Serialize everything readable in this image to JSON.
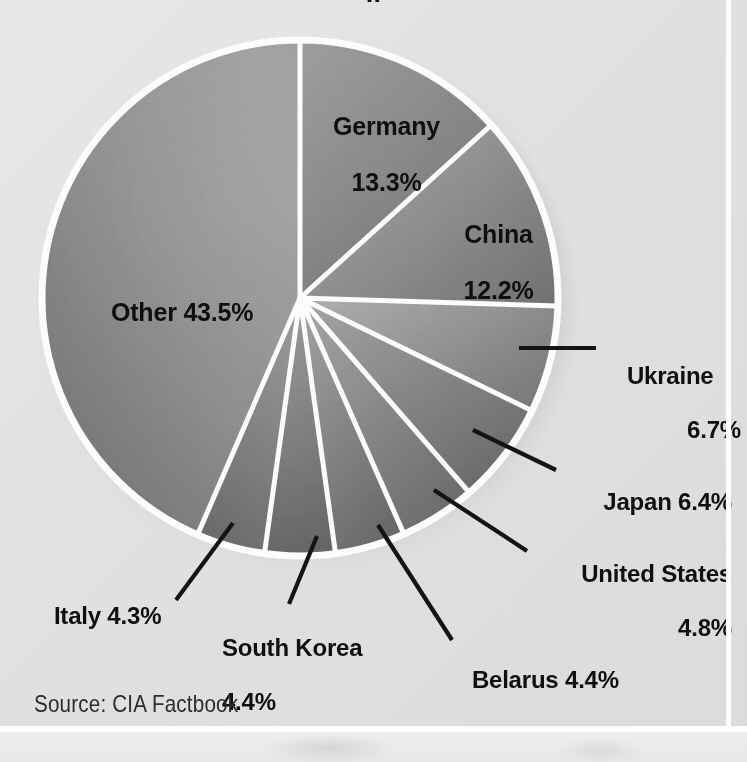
{
  "page": {
    "title_fragment": "..",
    "background_color": "#e8e8e8",
    "source_note": "Source: CIA Factbook"
  },
  "chart_data": {
    "type": "pie",
    "title": "",
    "xlabel": "",
    "ylabel": "",
    "legend_position": "none",
    "grid": false,
    "unit": "%",
    "start_angle_deg": 0,
    "direction": "clockwise",
    "categories": [
      "Germany",
      "China",
      "Ukraine",
      "Japan",
      "United States",
      "Belarus",
      "South Korea",
      "Italy",
      "Other"
    ],
    "values": [
      13.3,
      12.2,
      6.7,
      6.4,
      4.8,
      4.4,
      4.4,
      4.3,
      43.5
    ],
    "slices": [
      {
        "name": "Germany",
        "value": 13.3,
        "label": "Germany",
        "value_label": "13.3%",
        "label_mode": "inside",
        "fill": "#808080"
      },
      {
        "name": "China",
        "value": 12.2,
        "label": "China",
        "value_label": "12.2%",
        "label_mode": "inside",
        "fill": "#8c8c8c"
      },
      {
        "name": "Ukraine",
        "value": 6.7,
        "label": "Ukraine",
        "value_label": "6.7%",
        "label_mode": "callout",
        "fill": "#8f8f8f"
      },
      {
        "name": "Japan",
        "value": 6.4,
        "label": "Japan",
        "value_label": "6.4%",
        "label_mode": "callout",
        "fill": "#8a8a8a"
      },
      {
        "name": "United States",
        "value": 4.8,
        "label": "United States",
        "value_label": "4.8%",
        "label_mode": "callout",
        "fill": "#858585"
      },
      {
        "name": "Belarus",
        "value": 4.4,
        "label": "Belarus",
        "value_label": "4.4%",
        "label_mode": "callout",
        "fill": "#818181"
      },
      {
        "name": "South Korea",
        "value": 4.4,
        "label": "South Korea",
        "value_label": "4.4%",
        "label_mode": "callout",
        "fill": "#7d7d7d"
      },
      {
        "name": "Italy",
        "value": 4.3,
        "label": "Italy",
        "value_label": "4.3%",
        "label_mode": "callout",
        "fill": "#797979"
      },
      {
        "name": "Other",
        "value": 43.5,
        "label": "Other",
        "value_label": "43.5%",
        "label_mode": "inside",
        "fill": "#888888"
      }
    ]
  },
  "labels": {
    "germany_name": "Germany",
    "germany_pct": "13.3%",
    "china_name": "China",
    "china_pct": "12.2%",
    "other": "Other 43.5%",
    "ukraine_name": "Ukraine",
    "ukraine_pct": "6.7%",
    "japan": "Japan 6.4%",
    "usa_name": "United States",
    "usa_pct": "4.8%",
    "belarus": "Belarus 4.4%",
    "skorea_name": "South Korea",
    "skorea_pct": "4.4%",
    "italy": "Italy 4.3%"
  }
}
